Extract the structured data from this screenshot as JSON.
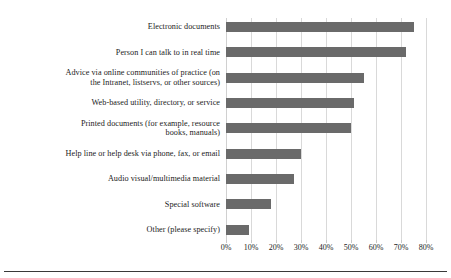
{
  "chart_data": {
    "type": "bar",
    "orientation": "horizontal",
    "title": "",
    "subtitle": "",
    "xlabel": "",
    "ylabel": "",
    "xlim": [
      0,
      80
    ],
    "grid": true,
    "legend": "none",
    "tick_labels": [
      "0%",
      "10%",
      "20%",
      "30%",
      "40%",
      "50%",
      "60%",
      "70%",
      "80%"
    ],
    "tick_values": [
      0,
      10,
      20,
      30,
      40,
      50,
      60,
      70,
      80
    ],
    "categories": [
      "Electronic documents",
      "Person I can talk to in real time",
      "Advice via online communities of practice (on\nthe Intranet, listservs, or other sources)",
      "Web-based utility, directory, or service",
      "Printed documents (for example, resource\nbooks, manuals)",
      "Help line or help desk via phone, fax, or email",
      "Audio visual/multimedia material",
      "Special software",
      "Other (please specify)"
    ],
    "values": [
      75,
      72,
      55,
      51,
      50,
      30,
      27,
      18,
      9
    ],
    "value_labels": [
      "75%",
      "72%",
      "55%",
      "51%",
      "50%",
      "30%",
      "27%",
      "18%",
      "9%"
    ],
    "colors": {
      "bar": "#6a6a6a",
      "gridline": "#d9d9d9",
      "text": "#1c1c1c",
      "rule": "#3a3a3a",
      "background": "#ffffff"
    }
  }
}
